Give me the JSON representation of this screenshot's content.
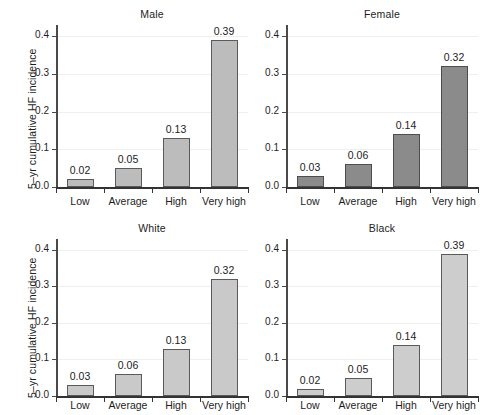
{
  "figure": {
    "width": 490,
    "height": 415,
    "background": "#ffffff",
    "ylabel": "5–yr cumulative HF incidence",
    "ytick_labels": [
      "0.0",
      "0.1",
      "0.2",
      "0.3",
      "0.4"
    ],
    "ytick_values": [
      0.0,
      0.1,
      0.2,
      0.3,
      0.4
    ],
    "categories": [
      "Low",
      "Average",
      "High",
      "Very high"
    ],
    "ylim": [
      0.0,
      0.43
    ],
    "grid": "horizontal",
    "legend": "none"
  },
  "chart_data": [
    {
      "type": "bar",
      "title": "Male",
      "panel": "top-left",
      "categories": [
        "Low",
        "Average",
        "High",
        "Very high"
      ],
      "values": [
        0.02,
        0.05,
        0.13,
        0.39
      ],
      "labels": [
        "0.02",
        "0.05",
        "0.13",
        "0.39"
      ],
      "bar_color": "#bcbcbc",
      "bar_edge_color": "#5a5a5a",
      "xlabel": "",
      "ylabel": "5–yr cumulative HF incidence",
      "ylim": [
        0.0,
        0.43
      ],
      "yticks": [
        0.0,
        0.1,
        0.2,
        0.3,
        0.4
      ],
      "ytick_labels": [
        "0.0",
        "0.1",
        "0.2",
        "0.3",
        "0.4"
      ]
    },
    {
      "type": "bar",
      "title": "Female",
      "panel": "top-right",
      "categories": [
        "Low",
        "Average",
        "High",
        "Very high"
      ],
      "values": [
        0.03,
        0.06,
        0.14,
        0.32
      ],
      "labels": [
        "0.03",
        "0.06",
        "0.14",
        "0.32"
      ],
      "bar_color": "#8b8b8b",
      "bar_edge_color": "#4d4d4d",
      "xlabel": "",
      "ylabel": "",
      "ylim": [
        0.0,
        0.43
      ],
      "yticks": [
        0.0,
        0.1,
        0.2,
        0.3,
        0.4
      ],
      "ytick_labels": [
        "0.0",
        "0.1",
        "0.2",
        "0.3",
        "0.4"
      ]
    },
    {
      "type": "bar",
      "title": "White",
      "panel": "bottom-left",
      "categories": [
        "Low",
        "Average",
        "High",
        "Very high"
      ],
      "values": [
        0.03,
        0.06,
        0.13,
        0.32
      ],
      "labels": [
        "0.03",
        "0.06",
        "0.13",
        "0.32"
      ],
      "bar_color": "#c9c9c9",
      "bar_edge_color": "#5a5a5a",
      "xlabel": "",
      "ylabel": "5–yr cumulative HF incidence",
      "ylim": [
        0.0,
        0.43
      ],
      "yticks": [
        0.0,
        0.1,
        0.2,
        0.3,
        0.4
      ],
      "ytick_labels": [
        "0.0",
        "0.1",
        "0.2",
        "0.3",
        "0.4"
      ]
    },
    {
      "type": "bar",
      "title": "Black",
      "panel": "bottom-right",
      "categories": [
        "Low",
        "Average",
        "High",
        "Very high"
      ],
      "values": [
        0.02,
        0.05,
        0.14,
        0.39
      ],
      "labels": [
        "0.02",
        "0.05",
        "0.14",
        "0.39"
      ],
      "bar_color": "#cdcdcd",
      "bar_edge_color": "#5a5a5a",
      "xlabel": "",
      "ylabel": "",
      "ylim": [
        0.0,
        0.43
      ],
      "yticks": [
        0.0,
        0.1,
        0.2,
        0.3,
        0.4
      ],
      "ytick_labels": [
        "0.0",
        "0.1",
        "0.2",
        "0.3",
        "0.4"
      ]
    }
  ]
}
